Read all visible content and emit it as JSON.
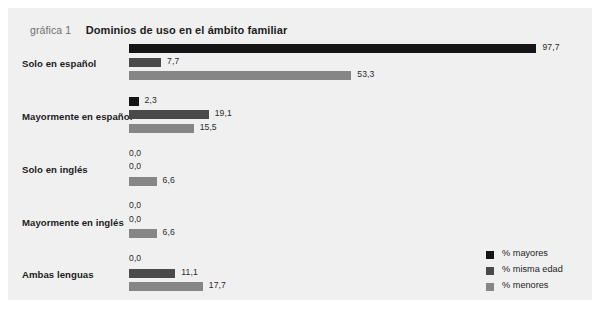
{
  "figure": {
    "caption_label": "gráfica 1",
    "caption_title": "Dominios de uso en el ámbito familiar",
    "panel_bg": "#f0f0f0"
  },
  "legend": {
    "items": [
      {
        "label": "% mayores",
        "color": "#151515"
      },
      {
        "label": "% misma edad",
        "color": "#4a4a4a"
      },
      {
        "label": "% menores",
        "color": "#868686"
      }
    ]
  },
  "chart_data": {
    "type": "bar",
    "orientation": "horizontal",
    "title": "Dominios de uso en el ámbito familiar",
    "xlabel": "",
    "ylabel": "",
    "xlim": [
      0,
      100
    ],
    "grid": false,
    "legend_position": "bottom-right",
    "decimal_separator": ",",
    "categories": [
      "Solo en español",
      "Mayormente en español",
      "Solo en inglés",
      "Mayormente en inglés",
      "Ambas lenguas"
    ],
    "series": [
      {
        "name": "% mayores",
        "color": "#151515",
        "values": [
          97.7,
          2.3,
          0.0,
          0.0,
          0.0
        ],
        "labels": [
          "97,7",
          "2,3",
          "0,0",
          "0,0",
          "0,0"
        ]
      },
      {
        "name": "% misma edad",
        "color": "#4a4a4a",
        "values": [
          7.7,
          19.1,
          0.0,
          0.0,
          11.1
        ],
        "labels": [
          "7,7",
          "19,1",
          "0,0",
          "0,0",
          "11,1"
        ]
      },
      {
        "name": "% menores",
        "color": "#868686",
        "values": [
          53.3,
          15.5,
          6.6,
          6.6,
          17.7
        ],
        "labels": [
          "53,3",
          "15,5",
          "6,6",
          "6,6",
          "17,7"
        ]
      }
    ]
  }
}
